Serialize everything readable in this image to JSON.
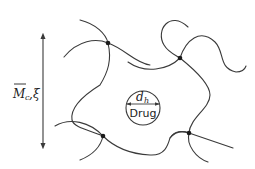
{
  "diagram": {
    "type": "polymer-network-mesh",
    "axis_label": {
      "symbol": "M",
      "subscript": "c",
      "separator": ",",
      "second_symbol": "ξ",
      "overline": true
    },
    "drug": {
      "label": "Drug",
      "size_symbol": "d",
      "size_subscript": "h"
    },
    "crosslinks": 4,
    "colors": {
      "line": "#3a3a3a",
      "node": "#1a1a1a",
      "background": "#ffffff"
    }
  }
}
